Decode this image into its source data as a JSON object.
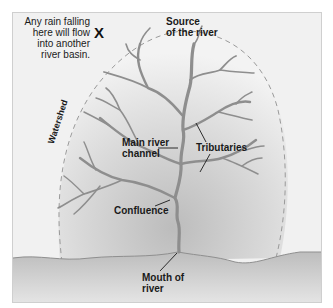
{
  "diagram": {
    "note": {
      "lines": [
        "Any rain falling",
        "here will flow",
        "into another",
        "river basin."
      ],
      "marker": "X"
    },
    "labels": {
      "source": [
        "Source",
        "of the river"
      ],
      "watershed": "Watershed",
      "main_channel": [
        "Main river",
        "channel"
      ],
      "tributaries": "Tributaries",
      "confluence": "Confluence",
      "mouth": [
        "Mouth of",
        "river"
      ]
    },
    "colors": {
      "river": "#8e8e8e",
      "basin_center": "#c9c9c9",
      "basin_edge": "#f2f2f2",
      "land": "#bdbdbd",
      "watershed_line": "#9a9a9a",
      "label_text": "#1a1a1a"
    }
  }
}
